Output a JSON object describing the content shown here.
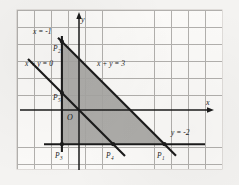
{
  "figure": {
    "type": "coordinate-geometry-diagram",
    "background_color": "#fbfaf8",
    "grid_color": "#9a9894",
    "ink_color": "#1b1b1b",
    "shade_color": "#a6a5a2"
  },
  "axes": {
    "x_label": "x",
    "y_label": "y",
    "origin_label": "O",
    "x_range": [
      -4,
      8
    ],
    "y_range": [
      -3,
      6
    ],
    "grid_spacing": 1
  },
  "lines": [
    {
      "label": "x = -1",
      "equation": "x = -1",
      "kind": "vertical"
    },
    {
      "label": "x + y = 3",
      "equation": "x + y = 3",
      "kind": "oblique"
    },
    {
      "label": "x + y = 0",
      "equation": "x + y = 0",
      "kind": "oblique"
    },
    {
      "label": "y = -2",
      "equation": "y = -2",
      "kind": "horizontal"
    }
  ],
  "points": [
    {
      "name": "P",
      "subscript": "1",
      "label": "P1",
      "x": 5,
      "y": -2,
      "on": [
        "x + y = 3",
        "y = -2"
      ]
    },
    {
      "name": "P",
      "subscript": "2",
      "label": "P2",
      "x": -1,
      "y": 4,
      "on": [
        "x = -1",
        "x + y = 3"
      ]
    },
    {
      "name": "P",
      "subscript": "3",
      "label": "P3",
      "x": -1,
      "y": -2,
      "on": [
        "x = -1",
        "y = -2"
      ]
    },
    {
      "name": "P",
      "subscript": "4",
      "label": "P4",
      "x": 2,
      "y": -2,
      "on": [
        "x + y = 0",
        "y = -2"
      ]
    },
    {
      "name": "P",
      "subscript": "5",
      "label": "P5",
      "x": -1,
      "y": 1,
      "on": [
        "x = -1",
        "x + y = 0"
      ]
    }
  ],
  "shaded_region": {
    "vertices": [
      "P2",
      "P1",
      "P3"
    ],
    "fill": "#a6a5a2"
  }
}
